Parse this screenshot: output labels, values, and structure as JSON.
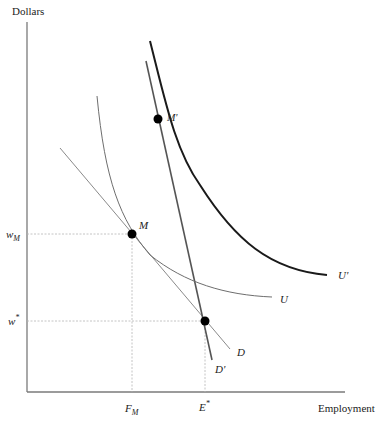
{
  "diagram": {
    "axes": {
      "y_label": "Dollars",
      "x_label": "Employment"
    },
    "y_ticks": [
      {
        "label_main": "w",
        "label_sub": "M",
        "y": 234
      },
      {
        "label_main": "w",
        "label_sup": "*",
        "y": 321
      }
    ],
    "x_ticks": [
      {
        "label_main": "F",
        "label_sub": "M",
        "x": 132
      },
      {
        "label_main": "E",
        "label_sup": "*",
        "x": 205
      }
    ],
    "points": [
      {
        "name": "M",
        "x": 132,
        "y": 234
      },
      {
        "name": "M'",
        "x": 158,
        "y": 119
      },
      {
        "name": "E*",
        "x": 205,
        "y": 321
      }
    ],
    "curves": {
      "D": "D",
      "D_prime": "D'",
      "U": "U",
      "U_prime": "U'"
    },
    "colors": {
      "axis": "#7a7a7a",
      "thin_curve": "#6e6e6e",
      "thick_curve": "#1a1a1a",
      "dashed": "#b5b5b5",
      "point": "#000000"
    }
  }
}
